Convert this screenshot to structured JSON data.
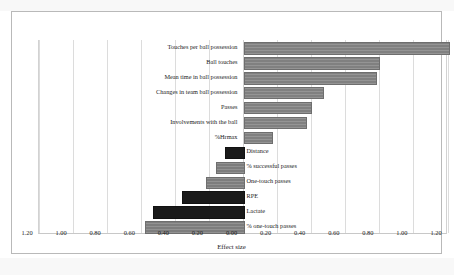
{
  "chart_data": {
    "type": "bar",
    "orientation": "horizontal",
    "title": "",
    "xlabel": "Effect size",
    "ylabel": "",
    "xlim": [
      -1.2,
      1.2
    ],
    "xticks": [
      "1.20",
      "1.00",
      "0.80",
      "0.60",
      "0.40",
      "0.20",
      "0.00",
      "0.20",
      "0.40",
      "0.60",
      "0.80",
      "1.00",
      "1.20"
    ],
    "xtick_values": [
      -1.2,
      -1.0,
      -0.8,
      -0.6,
      -0.4,
      -0.2,
      0.0,
      0.2,
      0.4,
      0.6,
      0.8,
      1.0,
      1.2
    ],
    "grid": true,
    "legend": "none",
    "categories": [
      "Touches per ball possession",
      "Ball touches",
      "Mean time in ball possession",
      "Changes in team ball possession",
      "Passes",
      "Involvements with the ball",
      "%Hrmax",
      "Distance",
      "% successful  passes",
      "One-touch passes",
      "RPE",
      "Lactate",
      "% one-touch passes"
    ],
    "values": [
      1.2,
      0.79,
      0.77,
      0.46,
      0.39,
      0.36,
      0.16,
      -0.11,
      -0.16,
      -0.22,
      -0.36,
      -0.53,
      -0.58
    ],
    "bar_styles": [
      "gray",
      "gray",
      "gray",
      "gray",
      "gray",
      "gray",
      "dark",
      "dark",
      "gray",
      "gray",
      "dark",
      "dark",
      "gray"
    ],
    "colors": {
      "gray_bar": "#808080",
      "dark_bar": "#1a1a1a",
      "gridline": "#dcdcdc",
      "axis": "#c8c8c8",
      "text": "#1c1c1c",
      "background": "#ffffff",
      "frame": "#b9b9b9"
    }
  }
}
